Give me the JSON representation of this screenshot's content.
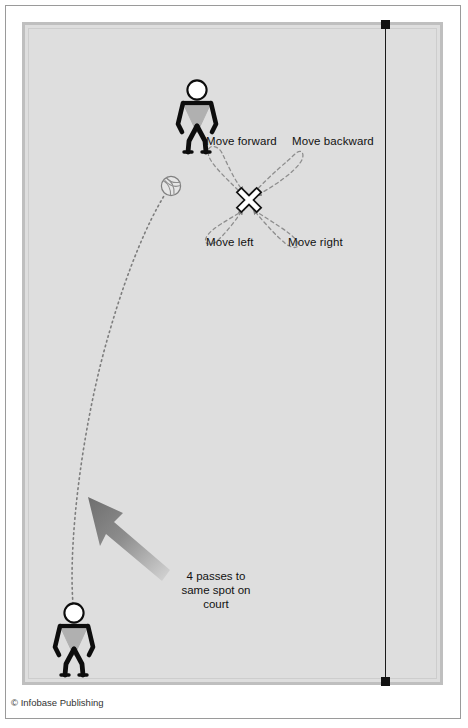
{
  "figure": {
    "credit": "© Infobase Publishing",
    "background_color": "#ffffff",
    "court_color": "#dedede",
    "court_border_color": "#bfbfbf",
    "line_color": "#1a1a1a"
  },
  "court": {
    "sideline_label": "sideline",
    "marker_color": "#111111"
  },
  "movement_labels": {
    "forward": "Move forward",
    "backward": "Move backward",
    "left": "Move left",
    "right": "Move right"
  },
  "caption": {
    "line1": "4 passes to",
    "line2": "same spot on",
    "line3": "court"
  },
  "players": [
    {
      "id": "passer-top",
      "role": "player-figure-top"
    },
    {
      "id": "tosser-bottom",
      "role": "player-figure-bottom"
    }
  ],
  "markers": {
    "target_spot": "x-target-marker",
    "ball": "volleyball-icon",
    "trajectory": "ball-path-dotted",
    "direction_arrow": "pass-direction-arrow"
  },
  "icons": {
    "x_marker": "x-marker-icon",
    "volleyball": "volleyball-icon",
    "arrow": "thick-arrow-icon",
    "player": "stick-figure-icon"
  },
  "colors": {
    "arrow_gradient_dark": "#6e6e6e",
    "arrow_gradient_light": "#cfcfcf",
    "dashed_arrow": "#8a8a8a",
    "dotted_path": "#7d7d7d",
    "figure_body": "#0d0d0d",
    "figure_torso": "#b0b0b0"
  }
}
